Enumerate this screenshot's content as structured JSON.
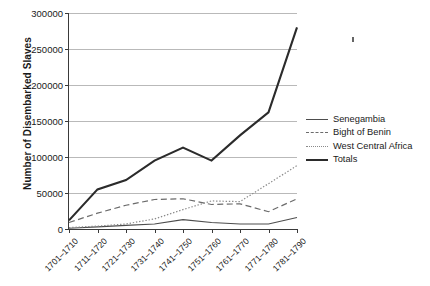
{
  "chart_data": {
    "type": "line",
    "title": "",
    "xlabel": "",
    "ylabel": "Number of Disembarked Slaves",
    "categories": [
      "1701–1710",
      "1711–1720",
      "1721–1730",
      "1731–1740",
      "1741–1750",
      "1751–1760",
      "1761–1770",
      "1771–1780",
      "1781–1790"
    ],
    "ylim": [
      0,
      300000
    ],
    "yticks": [
      0,
      50000,
      100000,
      150000,
      200000,
      250000,
      300000
    ],
    "ytick_labels": [
      "0",
      "50000",
      "100000",
      "150000",
      "200000",
      "250000",
      "300000"
    ],
    "grid": true,
    "legend_position": "right",
    "series": [
      {
        "name": "Senegambia",
        "style": "solid-thin",
        "color": "#4d4d4d",
        "values": [
          1000,
          3000,
          5000,
          7000,
          13000,
          9000,
          7000,
          7000,
          16000
        ]
      },
      {
        "name": "Bight of Benin",
        "style": "dashed",
        "color": "#6b6b6b",
        "values": [
          9000,
          22000,
          33000,
          41000,
          42000,
          34000,
          35000,
          24000,
          42000
        ]
      },
      {
        "name": "West Central Africa",
        "style": "dotted",
        "color": "#8a8a8a",
        "values": [
          2000,
          4000,
          7000,
          14000,
          27000,
          39000,
          38000,
          63000,
          88000
        ]
      },
      {
        "name": "Totals",
        "style": "solid-thick",
        "color": "#2b2b2b",
        "values": [
          12000,
          55000,
          68000,
          95000,
          113000,
          95000,
          130000,
          162000,
          280000
        ]
      }
    ]
  },
  "legend": {
    "items": [
      {
        "label": "Senegambia"
      },
      {
        "label": "Bight of Benin"
      },
      {
        "label": "West Central Africa"
      },
      {
        "label": "Totals"
      }
    ]
  }
}
